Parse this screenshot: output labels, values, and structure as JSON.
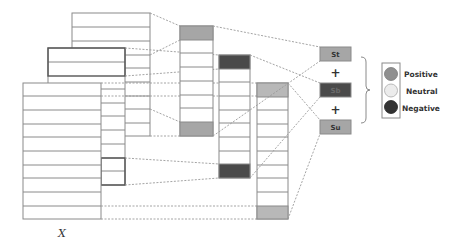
{
  "diagram": {
    "input_label": "X",
    "colors": {
      "positive": "#a6a6a6",
      "neutral": "#e6e6e6",
      "negative": "#4a4a4a",
      "stroke": "#8a8a8a",
      "dash": "#9a9a9a"
    },
    "outputs": [
      {
        "label": "St",
        "polarity": "positive"
      },
      {
        "label": "Sb",
        "polarity": "negative"
      },
      {
        "label": "Su",
        "polarity": "positive"
      }
    ],
    "operators": [
      "+",
      "+"
    ],
    "legend": {
      "items": [
        {
          "label": "Positive",
          "polarity": "positive"
        },
        {
          "label": "Neutral",
          "polarity": "neutral"
        },
        {
          "label": "Negative",
          "polarity": "negative"
        }
      ]
    },
    "columns": [
      {
        "name": "column-1",
        "rows": 8,
        "highlight_rows": [
          0,
          7
        ],
        "highlight_polarity": "positive"
      },
      {
        "name": "column-2",
        "rows": 9,
        "highlight_rows": [
          0,
          8
        ],
        "highlight_polarity": "negative"
      },
      {
        "name": "column-3",
        "rows": 10,
        "highlight_rows": [
          0,
          9
        ],
        "highlight_polarity": "positive"
      }
    ]
  }
}
